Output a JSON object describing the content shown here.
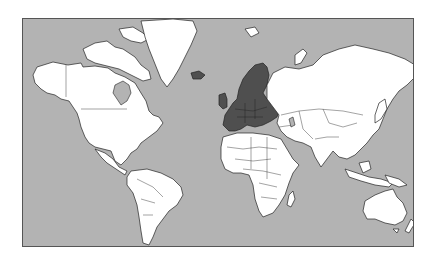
{
  "map": {
    "projection": "mercator",
    "extent": "world",
    "highlighted_region": "Europe",
    "colors": {
      "ocean": "#b3b3b3",
      "land": "#ffffff",
      "highlight": "#4f4f4f",
      "outline": "#222222",
      "background": "#ffffff"
    },
    "regions": [
      {
        "name": "North America",
        "highlighted": false
      },
      {
        "name": "Greenland",
        "highlighted": false
      },
      {
        "name": "South America",
        "highlighted": false
      },
      {
        "name": "Europe",
        "highlighted": true
      },
      {
        "name": "Africa",
        "highlighted": false
      },
      {
        "name": "Asia",
        "highlighted": false
      },
      {
        "name": "Australia",
        "highlighted": false
      }
    ]
  }
}
